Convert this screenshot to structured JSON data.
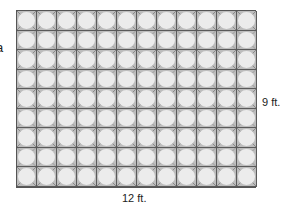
{
  "figure": {
    "left_fragment": "a",
    "grid": {
      "columns": 12,
      "rows": 9,
      "tile_fill": "#ececec",
      "corner_fill": "#bdbdbd",
      "line_color": "#5a5a5a"
    },
    "labels": {
      "height": "9 ft.",
      "width": "12 ft."
    }
  }
}
